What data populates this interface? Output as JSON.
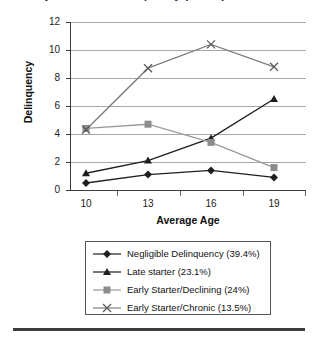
{
  "chart_data": {
    "type": "line",
    "title": "Trajectories of Delinquency (n=506)",
    "xlabel": "Average Age",
    "ylabel": "Delinquency",
    "categories": [
      "10",
      "13",
      "16",
      "19"
    ],
    "x_tick_labels": [
      "10",
      "13",
      "16",
      "19"
    ],
    "y_tick_labels": [
      "0",
      "2",
      "4",
      "6",
      "8",
      "10",
      "12"
    ],
    "ylim": [
      0,
      12
    ],
    "y_tick_step": 2,
    "grid": "horizontal",
    "legend_position": "below-plot",
    "series": [
      {
        "name": "Negligible Delinquency (39.4%)",
        "legend_label": "Negligible Delinquency (39.4%)",
        "marker": "diamond",
        "color": "#1f1f1f",
        "values": [
          0.5,
          1.1,
          1.4,
          0.9
        ]
      },
      {
        "name": "Late starter (23.1%)",
        "legend_label": "Late starter (23.1%)",
        "marker": "triangle",
        "color": "#1f1f1f",
        "values": [
          1.2,
          2.1,
          3.7,
          6.5
        ]
      },
      {
        "name": "Early Starter/Declining (24%)",
        "legend_label": "Early Starter/Declining (24%)",
        "marker": "square",
        "color": "#9a9a9a",
        "values": [
          4.4,
          4.7,
          3.4,
          1.6
        ]
      },
      {
        "name": "Early Starter/Chronic (13.5%)",
        "legend_label": "Early Starter/Chronic (13.5%)",
        "marker": "cross-x",
        "color": "#808080",
        "values": [
          4.3,
          8.7,
          10.4,
          8.8
        ]
      }
    ]
  },
  "axes": {
    "y_title": "Delinquency",
    "x_title": "Average Age",
    "y_ticks": [
      "12",
      "10",
      "8",
      "6",
      "4",
      "2",
      "0"
    ],
    "x_ticks": [
      "10",
      "13",
      "16",
      "19"
    ]
  },
  "legend": {
    "items": [
      {
        "label": "Negligible Delinquency (39.4%)",
        "marker": "diamond",
        "color": "#1f1f1f"
      },
      {
        "label": "Late starter (23.1%)",
        "marker": "triangle",
        "color": "#1f1f1f"
      },
      {
        "label": "Early Starter/Declining (24%)",
        "marker": "square",
        "color": "#9a9a9a"
      },
      {
        "label": "Early Starter/Chronic (13.5%)",
        "marker": "cross-x",
        "color": "#808080"
      }
    ]
  }
}
